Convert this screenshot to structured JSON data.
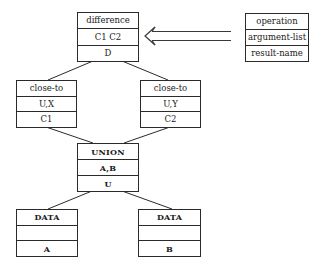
{
  "legend": {
    "rows": [
      "operation",
      "argument-list",
      "result-name"
    ]
  },
  "nodes": {
    "difference": {
      "operation": "difference",
      "arguments": "C1 C2",
      "result": "D"
    },
    "close_to_left": {
      "operation": "close-to",
      "arguments": "U,X",
      "result": "C1"
    },
    "close_to_right": {
      "operation": "close-to",
      "arguments": "U,Y",
      "result": "C2"
    },
    "union": {
      "operation": "UNION",
      "arguments": "A,B",
      "result": "U"
    },
    "data_a": {
      "operation": "DATA",
      "arguments": "",
      "result": "A"
    },
    "data_b": {
      "operation": "DATA",
      "arguments": "",
      "result": "B"
    }
  },
  "edges": [
    {
      "from": "difference",
      "to": "close_to_left"
    },
    {
      "from": "difference",
      "to": "close_to_right"
    },
    {
      "from": "close_to_left",
      "to": "union"
    },
    {
      "from": "close_to_right",
      "to": "union"
    },
    {
      "from": "union",
      "to": "data_a"
    },
    {
      "from": "union",
      "to": "data_b"
    }
  ],
  "legend_arrow": {
    "from": "legend",
    "to": "difference",
    "style": "hollow-double-line"
  },
  "colors": {
    "line": "#2a2a2a",
    "background": "#ffffff"
  }
}
